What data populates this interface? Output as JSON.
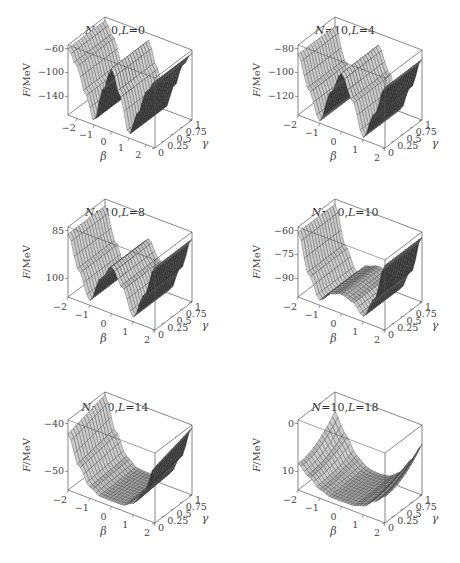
{
  "figure": {
    "panel_count": 6,
    "layout": "3 rows x 2 columns"
  },
  "chart_data": [
    {
      "type": "surface3d",
      "title": "N=10,L=0",
      "N": 10,
      "L": 0,
      "xlabel": "β",
      "ylabel": "γ",
      "zlabel": "F/MeV",
      "x_ticks": [
        "-2",
        "-1",
        "0",
        "1",
        "2"
      ],
      "y_ticks": [
        "0",
        "0.25",
        "0.5",
        "0.75",
        "1"
      ],
      "z_ticks": [
        "-60",
        "-100",
        "-140"
      ],
      "xlim": [
        -2.5,
        2.5
      ],
      "ylim": [
        0,
        1
      ],
      "zlim": [
        -150,
        -50
      ],
      "shape": "double well along β with two deep sharp valleys near β≈-1 and β≈1, central ridge at β≈0; nearly constant along γ",
      "profile_beta": [
        -2.5,
        -2,
        -1.5,
        -1,
        -0.5,
        0,
        0.5,
        1,
        1.5,
        2,
        2.5
      ],
      "profile_F": [
        -55,
        -75,
        -110,
        -145,
        -95,
        -60,
        -95,
        -145,
        -110,
        -75,
        -55
      ]
    },
    {
      "type": "surface3d",
      "title": "N=10,L=4",
      "N": 10,
      "L": 4,
      "xlabel": "β",
      "ylabel": "γ",
      "zlabel": "F/MeV",
      "x_ticks": [
        "-2",
        "-1",
        "0",
        "1",
        "2"
      ],
      "y_ticks": [
        "0",
        "0.25",
        "0.5",
        "0.75",
        "1"
      ],
      "z_ticks": [
        "-80",
        "-100",
        "-120"
      ],
      "xlim": [
        -2,
        2
      ],
      "ylim": [
        0,
        1
      ],
      "zlim": [
        -130,
        -70
      ],
      "shape": "double well along β with minima near β≈±1, central ridge at β≈0",
      "profile_beta": [
        -2,
        -1.5,
        -1,
        -0.5,
        0,
        0.5,
        1,
        1.5,
        2
      ],
      "profile_F": [
        -78,
        -105,
        -128,
        -100,
        -80,
        -100,
        -128,
        -105,
        -78
      ]
    },
    {
      "type": "surface3d",
      "title": "N=10,L=8",
      "N": 10,
      "L": 8,
      "xlabel": "β",
      "ylabel": "γ",
      "zlabel": "F/MeV",
      "x_ticks": [
        "-2",
        "-1",
        "0",
        "1",
        "2"
      ],
      "y_ticks": [
        "0",
        "0.25",
        "0.5",
        "0.75",
        "1"
      ],
      "z_ticks": [
        "85",
        "100"
      ],
      "xlim": [
        -2,
        2
      ],
      "ylim": [
        0,
        1
      ],
      "zlim": [
        -105,
        -75
      ],
      "shape": "shallower double well along β, minima near β≈±1, rounded central ridge",
      "profile_beta": [
        -2,
        -1.5,
        -1,
        -0.5,
        0,
        0.5,
        1,
        1.5,
        2
      ],
      "profile_F": [
        -78,
        -92,
        -103,
        -92,
        -85,
        -92,
        -103,
        -92,
        -78
      ]
    },
    {
      "type": "surface3d",
      "title": "N=10,L=10",
      "N": 10,
      "L": 10,
      "xlabel": "β",
      "ylabel": "γ",
      "zlabel": "F/MeV",
      "x_ticks": [
        "-2",
        "-1",
        "0",
        "1",
        "2"
      ],
      "y_ticks": [
        "0",
        "0.25",
        "0.5",
        "0.75",
        "1"
      ],
      "z_ticks": [
        "-60",
        "-75",
        "-90"
      ],
      "xlim": [
        -2,
        2
      ],
      "ylim": [
        0,
        1
      ],
      "zlim": [
        -95,
        -55
      ],
      "shape": "weak double well along β, low central ridge",
      "profile_beta": [
        -2,
        -1.5,
        -1,
        -0.5,
        0,
        0.5,
        1,
        1.5,
        2
      ],
      "profile_F": [
        -58,
        -80,
        -92,
        -86,
        -84,
        -86,
        -92,
        -80,
        -58
      ]
    },
    {
      "type": "surface3d",
      "title": "N=10,L=14",
      "N": 10,
      "L": 14,
      "xlabel": "β",
      "ylabel": "γ",
      "zlabel": "F/MeV",
      "x_ticks": [
        "-2",
        "-1",
        "0",
        "1",
        "2"
      ],
      "y_ticks": [
        "0",
        "0.25",
        "0.5",
        "0.75",
        "1"
      ],
      "z_ticks": [
        "-40",
        "-50"
      ],
      "xlim": [
        -2,
        2
      ],
      "ylim": [
        0,
        1
      ],
      "zlim": [
        -55,
        -30
      ],
      "shape": "single broad bowl with flat minimum around β≈0",
      "profile_beta": [
        -2,
        -1.5,
        -1,
        -0.5,
        0,
        0.5,
        1,
        1.5,
        2
      ],
      "profile_F": [
        -35,
        -45,
        -51,
        -53,
        -53,
        -53,
        -51,
        -45,
        -35
      ]
    },
    {
      "type": "surface3d",
      "title": "N=10,L=18",
      "N": 10,
      "L": 18,
      "xlabel": "β",
      "ylabel": "γ",
      "zlabel": "F/MeV",
      "x_ticks": [
        "-2",
        "-1",
        "0",
        "1",
        "2"
      ],
      "y_ticks": [
        "0",
        "0.25",
        "0.5",
        "0.75",
        "1"
      ],
      "z_ticks": [
        "0",
        "10"
      ],
      "xlim": [
        -2,
        2
      ],
      "ylim": [
        0,
        1
      ],
      "zlim": [
        -15,
        25
      ],
      "shape": "saddle-like valley; minimum near β≈0, rising strongly toward |β|=2 at large γ",
      "profile_beta": [
        -2,
        -1.5,
        -1,
        -0.5,
        0,
        0.5,
        1,
        1.5,
        2
      ],
      "profile_F": [
        0,
        -5,
        -10,
        -12,
        -12,
        -12,
        -10,
        -5,
        0
      ]
    }
  ],
  "panels": [
    {
      "title_N": "N",
      "title_eqN": "=10,",
      "title_L": "L",
      "title_eqL": "=0",
      "z_ticks": [
        "-60",
        "-100",
        "-140"
      ],
      "x_ticks": [
        "-2",
        "-1",
        "0",
        "1",
        "2"
      ],
      "y_ticks": [
        "0",
        "0.25",
        "0.5",
        "0.75",
        "1"
      ],
      "zlabel": "F/MeV",
      "xlabel": "β",
      "ylabel": "γ"
    },
    {
      "title_N": "N",
      "title_eqN": "=10,",
      "title_L": "L",
      "title_eqL": "=4",
      "z_ticks": [
        "-80",
        "-100",
        "-120"
      ],
      "x_ticks": [
        "-2",
        "-1",
        "0",
        "1",
        "2"
      ],
      "y_ticks": [
        "0",
        "0.25",
        "0.5",
        "0.75",
        "1"
      ],
      "zlabel": "F/MeV",
      "xlabel": "β",
      "ylabel": "γ"
    },
    {
      "title_N": "N",
      "title_eqN": "=10,",
      "title_L": "L",
      "title_eqL": "=8",
      "z_ticks": [
        "85",
        "100"
      ],
      "x_ticks": [
        "-2",
        "-1",
        "0",
        "1",
        "2"
      ],
      "y_ticks": [
        "0",
        "0.25",
        "0.5",
        "0.75",
        "1"
      ],
      "zlabel": "F/MeV",
      "xlabel": "β",
      "ylabel": "γ"
    },
    {
      "title_N": "N",
      "title_eqN": "=10,",
      "title_L": "L",
      "title_eqL": "=10",
      "z_ticks": [
        "-60",
        "-75",
        "-90"
      ],
      "x_ticks": [
        "-2",
        "-1",
        "0",
        "1",
        "2"
      ],
      "y_ticks": [
        "0",
        "0.25",
        "0.5",
        "0.75",
        "1"
      ],
      "zlabel": "F/MeV",
      "xlabel": "β",
      "ylabel": "γ"
    },
    {
      "title_N": "N",
      "title_eqN": "=10,",
      "title_L": "L",
      "title_eqL": "=14",
      "z_ticks": [
        "-40",
        "-50"
      ],
      "x_ticks": [
        "-2",
        "-1",
        "0",
        "1",
        "2"
      ],
      "y_ticks": [
        "0",
        "0.25",
        "0.5",
        "0.75",
        "1"
      ],
      "zlabel": "F/MeV",
      "xlabel": "β",
      "ylabel": "γ"
    },
    {
      "title_N": "N",
      "title_eqN": "=10,",
      "title_L": "L",
      "title_eqL": "=18",
      "z_ticks": [
        "0",
        "10"
      ],
      "x_ticks": [
        "-2",
        "-1",
        "0",
        "1",
        "2"
      ],
      "y_ticks": [
        "0",
        "0.25",
        "0.5",
        "0.75",
        "1"
      ],
      "zlabel": "F/MeV",
      "xlabel": "β",
      "ylabel": "γ"
    }
  ],
  "colors": {
    "surface_light": "#b8b8b8",
    "surface_dark": "#5a5a5a",
    "mesh": "#3a3a3a",
    "box": "#555555",
    "text": "#333333"
  }
}
